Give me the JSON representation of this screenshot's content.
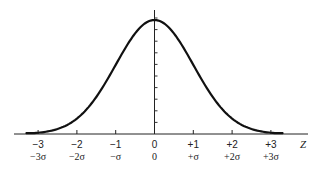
{
  "chart_data": {
    "type": "line",
    "title": "",
    "xlabel": "Z",
    "ylabel": "",
    "xlim": [
      -3.6,
      3.6
    ],
    "ylim": [
      0,
      0.42
    ],
    "grid": false,
    "legend": null,
    "series": [
      {
        "name": "Standard normal density",
        "function": "exp(-z^2/2)/sqrt(2*pi)",
        "x": [
          -3.3,
          -3,
          -2.5,
          -2,
          -1.5,
          -1,
          -0.5,
          0,
          0.5,
          1,
          1.5,
          2,
          2.5,
          3,
          3.3
        ],
        "values": [
          0.0017,
          0.0044,
          0.0175,
          0.054,
          0.1295,
          0.242,
          0.3521,
          0.3989,
          0.3521,
          0.242,
          0.1295,
          0.054,
          0.0175,
          0.0044,
          0.0017
        ]
      }
    ],
    "x_ticks": [
      {
        "value": -3,
        "label": "−3",
        "sublabel": "−3σ"
      },
      {
        "value": -2,
        "label": "−2",
        "sublabel": "−2σ"
      },
      {
        "value": -1,
        "label": "−1",
        "sublabel": "−σ"
      },
      {
        "value": 0,
        "label": "0",
        "sublabel": "0"
      },
      {
        "value": 1,
        "label": "+1",
        "sublabel": "+σ"
      },
      {
        "value": 2,
        "label": "+2",
        "sublabel": "+2σ"
      },
      {
        "value": 3,
        "label": "+3",
        "sublabel": "+3σ"
      }
    ],
    "y_axis_minor_ticks": 10
  },
  "colors": {
    "curve": "#111111",
    "axis": "#222222",
    "background": "#ffffff"
  }
}
